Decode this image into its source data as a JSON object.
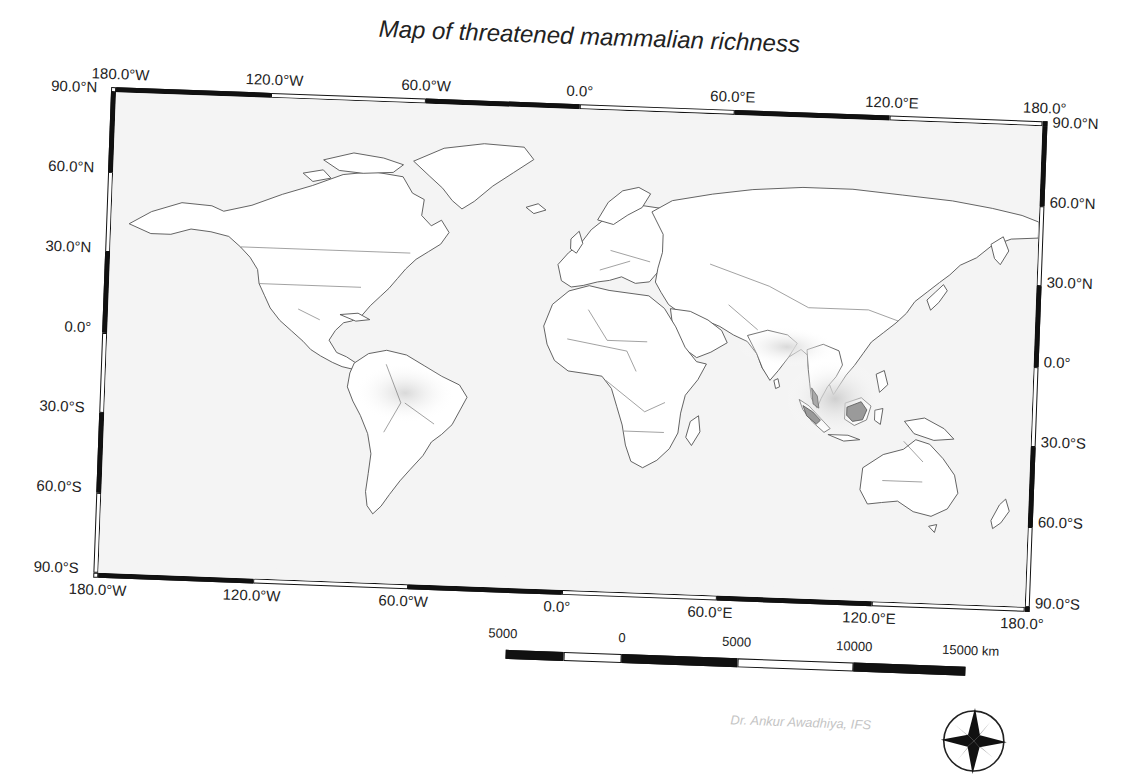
{
  "map": {
    "title": "Map of threatened mammalian richness",
    "projection": "equirectangular",
    "extent": {
      "lon": [
        -180,
        180
      ],
      "lat": [
        -90,
        90
      ]
    },
    "frame": {
      "top_labels": [
        "180.0°W",
        "120.0°W",
        "60.0°W",
        "0.0°",
        "60.0°E",
        "120.0°E",
        "180.0°"
      ],
      "bottom_labels": [
        "180.0°W",
        "120.0°W",
        "60.0°W",
        "0.0°",
        "60.0°E",
        "120.0°E",
        "180.0°"
      ],
      "left_labels": [
        "90.0°N",
        "60.0°N",
        "30.0°N",
        "0.0°",
        "30.0°S",
        "60.0°S",
        "90.0°S"
      ],
      "right_labels": [
        "90.0°N",
        "60.0°N",
        "30.0°N",
        "0.0°",
        "30.0°S",
        "60.0°S",
        "90.0°S"
      ],
      "tick_interval_deg": 30,
      "annotation_interval_deg": 60
    },
    "colors": {
      "background": "#f4f4f4",
      "land": "#ffffff",
      "borders": "#555555",
      "richness_low": "#e6e6e6",
      "richness_high": "#8a8a8a",
      "frame": "#111111"
    },
    "hotspots": [
      {
        "name": "Amazon Basin",
        "intensity": "low-medium"
      },
      {
        "name": "Southeast Asia (Borneo, Sumatra, Malay Peninsula, Indochina)",
        "intensity": "high"
      },
      {
        "name": "South Asia / Himalaya",
        "intensity": "low"
      }
    ]
  },
  "scale_bar": {
    "labels": [
      "5000",
      "0",
      "5000",
      "10000",
      "15000 km"
    ],
    "unit": "km"
  },
  "credit": {
    "text": "Dr. Ankur Awadhiya, IFS"
  },
  "compass": {
    "icon": "compass-rose-icon"
  }
}
